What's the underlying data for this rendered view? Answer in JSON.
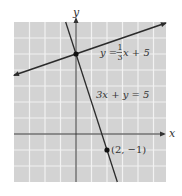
{
  "chart_data": {
    "type": "line",
    "title": "",
    "xlabel": "x",
    "ylabel": "y",
    "xlim": [
      -4,
      5.8
    ],
    "ylim": [
      -3,
      7
    ],
    "grid": true,
    "grid_step": 1,
    "series": [
      {
        "name": "line1",
        "equation": "y = (1/3)x + 5",
        "label_parts": {
          "lhs": "y =",
          "num": "1",
          "den": "3",
          "rhs": "x + 5"
        },
        "slope": 0.3333333,
        "intercept": 5,
        "x_range": [
          -4,
          5.8
        ],
        "arrows": true
      },
      {
        "name": "line2",
        "equation": "3x + y = 5",
        "label": "3x + y = 5",
        "slope": -3,
        "intercept": 5,
        "x_range": [
          -0.667,
          2.667
        ],
        "arrows": false
      }
    ],
    "points": [
      {
        "x": 0,
        "y": 5,
        "label": ""
      },
      {
        "x": 2,
        "y": -1,
        "label": "(2, −1)"
      }
    ],
    "colors": {
      "background": "#d3d3d3",
      "gridline": "#f2f2f2",
      "line": "#2b2b2b",
      "axis": "#333333"
    }
  }
}
